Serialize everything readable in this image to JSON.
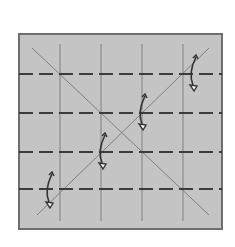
{
  "diagram": {
    "type": "origami-crease-pattern",
    "paper": {
      "x": 19,
      "y": 34,
      "width": 203,
      "height": 195,
      "fill": "#c4c4c4",
      "stroke": "#6e6e6e"
    },
    "valley_folds_vertical_x": [
      60,
      101,
      142,
      183
    ],
    "mountain_folds_horizontal_y": [
      74,
      113,
      152,
      189
    ],
    "diagonals": [
      {
        "name": "diagonal-a",
        "x1": 32,
        "y1": 48,
        "x2": 209,
        "y2": 215
      },
      {
        "name": "diagonal-b",
        "x1": 209,
        "y1": 48,
        "x2": 37,
        "y2": 215
      }
    ],
    "fold_arrows": [
      {
        "name": "fold-arrow-1",
        "x": 49,
        "top": 172,
        "bottom": 208
      },
      {
        "name": "fold-arrow-2",
        "x": 102,
        "top": 133,
        "bottom": 169
      },
      {
        "name": "fold-arrow-3",
        "x": 142,
        "top": 94,
        "bottom": 130
      },
      {
        "name": "fold-arrow-4",
        "x": 193,
        "top": 55,
        "bottom": 91
      }
    ],
    "colors": {
      "line": "#808080",
      "dash": "#3c3c3c",
      "arrow": "#333333"
    }
  }
}
